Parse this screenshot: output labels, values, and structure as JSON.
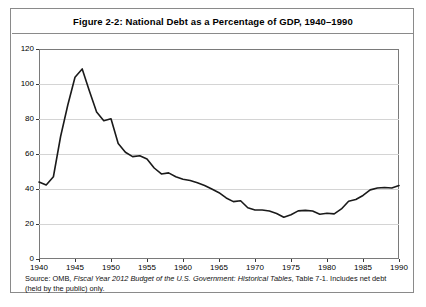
{
  "figure": {
    "title": "Figure 2-2: National Debt as a Percentage of GDP, 1940–1990",
    "source_note": "Source: OMB, Fiscal Year 2012 Budget of the U.S. Government: Historical Tables, Table 7-1. Includes net debt (held by the public) only.",
    "source_parts": {
      "lead": "Source: OMB, ",
      "italic": "Fiscal Year 2012 Budget of the U.S. Government: Historical Tables",
      "tail": ", Table 7-1. Includes net debt (held by the public) only."
    }
  },
  "chart_data": {
    "type": "line",
    "title": "Figure 2-2: National Debt as a Percentage of GDP, 1940–1990",
    "xlabel": "",
    "ylabel": "",
    "xlim": [
      1940,
      1990
    ],
    "ylim": [
      0,
      120
    ],
    "grid": true,
    "legend": "none",
    "line_color": "#1a1a1a",
    "xticks": [
      1940,
      1945,
      1950,
      1955,
      1960,
      1965,
      1970,
      1975,
      1980,
      1985,
      1990
    ],
    "yticks": [
      0,
      20,
      40,
      60,
      80,
      100,
      120
    ],
    "series": [
      {
        "name": "National debt held by the public (% of GDP)",
        "x": [
          1940,
          1941,
          1942,
          1943,
          1944,
          1945,
          1946,
          1947,
          1948,
          1949,
          1950,
          1951,
          1952,
          1953,
          1954,
          1955,
          1956,
          1957,
          1958,
          1959,
          1960,
          1961,
          1962,
          1963,
          1964,
          1965,
          1966,
          1967,
          1968,
          1969,
          1970,
          1971,
          1972,
          1973,
          1974,
          1975,
          1976,
          1977,
          1978,
          1979,
          1980,
          1981,
          1982,
          1983,
          1984,
          1985,
          1986,
          1987,
          1988,
          1989,
          1990
        ],
        "values": [
          44.0,
          42.3,
          47.0,
          70.0,
          88.0,
          103.9,
          108.6,
          96.0,
          84.0,
          79.0,
          80.1,
          66.0,
          61.0,
          58.5,
          59.0,
          57.2,
          52.0,
          48.6,
          49.2,
          47.0,
          45.6,
          44.9,
          43.6,
          42.0,
          40.0,
          37.9,
          34.9,
          32.8,
          33.3,
          29.3,
          28.0,
          28.0,
          27.4,
          26.0,
          23.9,
          25.3,
          27.5,
          27.8,
          27.4,
          25.6,
          26.1,
          25.8,
          28.6,
          33.0,
          34.0,
          36.3,
          39.5,
          40.6,
          40.9,
          40.6,
          42.0
        ]
      }
    ]
  }
}
